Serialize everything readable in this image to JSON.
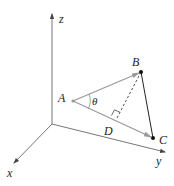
{
  "diagram": {
    "type": "3d-vector-projection",
    "axes": {
      "z_label": "z",
      "x_label": "x",
      "y_label": "y"
    },
    "points": {
      "A": "A",
      "B": "B",
      "C": "C",
      "D": "D"
    },
    "angle_label": "θ",
    "colors": {
      "axis": "#6f6f6f",
      "vector": "#8a8a8a",
      "point": "#111111",
      "text": "#222222"
    }
  }
}
